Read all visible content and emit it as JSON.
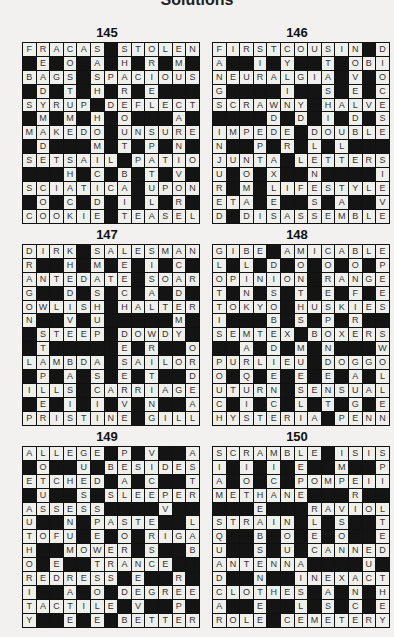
{
  "page": {
    "heading": "Solutions"
  },
  "puzzles": [
    {
      "number": "145",
      "rows": [
        "FRACAS#STOLEN",
        "#E#O#A#H#R#M#",
        "BAGS#SPACIOUS",
        "#D#T#H#R#E###",
        "SYRUP#DEFLECT",
        "#M#M#H#O###A#",
        "MAKEDO#UNSURE",
        "#D###M#T#P#N#",
        "SETSAIL#PATIO",
        "###H#C#B#T#V#",
        "SCIATICA#UPON",
        "#O#C#D#I#L#R#",
        "COOKIE#TEASEL"
      ]
    },
    {
      "number": "146",
      "rows": [
        "FIRSTCOUSIN#D",
        "A##I#Y##T#OBI",
        "NEURALGIA#V#O",
        "G####I##S#E#C",
        "SCRAWNY#HALVE",
        "####D#D#I#D#S",
        "IMPEDE#DOUBLE",
        "N##P#R#L#L###",
        "JUNTA#LETTERS",
        "U#O#X##N####I",
        "R#M#LIFESTYLE",
        "ETA#E##S#A##V",
        "D#DISASSEMBLE"
      ]
    },
    {
      "number": "147",
      "rows": [
        "DIRK#SALESMAN",
        "R##H#M#E#I#C#",
        "ANTEDATE#SOAR",
        "G##D#S#C#A#D#",
        "OWLISH#HALTER",
        "N##V#U#####M#",
        "#STEEP#DOWDY#",
        "#T#####E#R##O",
        "LAMBDA#SAILOR",
        "#P#A#S#E#T##D",
        "ILLS#CARRIAGE",
        "#E#I#I#V#N##A",
        "PRISTINE#GILL"
      ]
    },
    {
      "number": "148",
      "rows": [
        "GIBE#AMICABLE",
        "L#L#D#O#O#O#P",
        "OPINION#RANGE",
        "T#N#S#T#E#F#E",
        "TOKYO#HUSKIES",
        "I###B#S#P#R##",
        "SEMTEX#BOXERS",
        "##A#D#M#N###W",
        "PURLIEU#DOGGO",
        "O#Q#E#E#E#A#L",
        "UTURN#SENSUAL",
        "C#I#C#L#T#G#E",
        "HYSTERIA#PENN"
      ]
    },
    {
      "number": "149",
      "rows": [
        "ALLEGE#P#V##A",
        "#O##U#BESIDES",
        "ETCHED#A#C##T",
        "#U##S#SLEEPER",
        "ASSESS####V##O",
        "U##N#PASTE##L",
        "TOFU#E#O#RIGA",
        "H##MOWER#S##B",
        "O#E##TRANCE",
        "REDRESS#E##R#",
        "I##A#O#DEGREE",
        "TACTILE#V##P#",
        "Y##E#E#BETTER"
      ]
    },
    {
      "number": "150",
      "rows": [
        "SCRAMBLE#ISIS",
        "I#I#I#E##M##P",
        "A#O#C#POMPEII",
        "METHANE###R##R",
        "###E###RAVIOLI",
        "STRAIN#L#S##T",
        "Q##B#O#E#O##E",
        "U##S#U#CANNED",
        "ANTENNA####U##",
        "D##N##INEXACT",
        "CLOTHES#A#N#H",
        "A##E##L#S#C#E",
        "ROLE#CEMETERY"
      ]
    }
  ]
}
